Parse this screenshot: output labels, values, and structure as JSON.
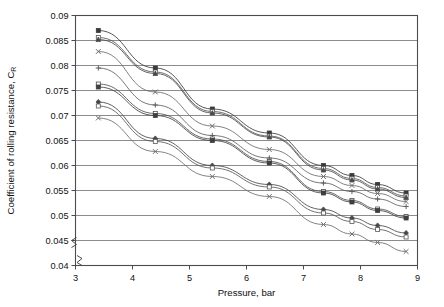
{
  "chart_data": {
    "type": "line",
    "title": "",
    "xlabel": "Pressure, bar",
    "ylabel": "Coefficient of rolling resistance, C",
    "ylabel_sub": "R",
    "xlim": [
      3,
      9
    ],
    "ylim": [
      0.04,
      0.09
    ],
    "y_axis_break": true,
    "grid": true,
    "legend": "none",
    "xticks": [
      3,
      4,
      5,
      6,
      7,
      8,
      9
    ],
    "xticklabels": [
      "3",
      "4",
      "5",
      "6",
      "7",
      "8",
      "9"
    ],
    "yticks": [
      0.04,
      0.045,
      0.05,
      0.055,
      0.06,
      0.065,
      0.07,
      0.075,
      0.08,
      0.085,
      0.09
    ],
    "yticklabels": [
      "0.04",
      "0.045",
      "0.05",
      "0.055",
      "0.06",
      "0.065",
      "0.07",
      "0.075",
      "0.08",
      "0.085",
      "0.09"
    ],
    "x": [
      3.4,
      4.4,
      5.4,
      6.4,
      7.35,
      7.85,
      8.3,
      8.8
    ],
    "series": [
      {
        "name": "Series 1",
        "marker": "square-filled",
        "color": "#3a3a3a",
        "values": [
          0.087,
          0.0795,
          0.0713,
          0.0665,
          0.06,
          0.058,
          0.0562,
          0.0545
        ]
      },
      {
        "name": "Series 2",
        "marker": "square-open",
        "color": "#555555",
        "values": [
          0.0856,
          0.0787,
          0.0708,
          0.0659,
          0.0594,
          0.0574,
          0.0556,
          0.0539
        ]
      },
      {
        "name": "Series 3",
        "marker": "triangle-filled",
        "color": "#4a4a4a",
        "values": [
          0.0852,
          0.0784,
          0.0705,
          0.0657,
          0.0591,
          0.0571,
          0.0553,
          0.0536
        ]
      },
      {
        "name": "Series 4",
        "marker": "cross",
        "color": "#6a6a6a",
        "values": [
          0.0828,
          0.0747,
          0.0679,
          0.0632,
          0.0578,
          0.056,
          0.0544,
          0.0528
        ]
      },
      {
        "name": "Series 5",
        "marker": "plus",
        "color": "#5e5e5e",
        "values": [
          0.0795,
          0.0721,
          0.066,
          0.0615,
          0.0565,
          0.0548,
          0.0533,
          0.0518
        ]
      },
      {
        "name": "Series 6",
        "marker": "square-open",
        "color": "#4f4f4f",
        "values": [
          0.0763,
          0.0704,
          0.0653,
          0.0608,
          0.0548,
          0.053,
          0.0513,
          0.0498
        ]
      },
      {
        "name": "Series 7",
        "marker": "square-filled",
        "color": "#3f3f3f",
        "values": [
          0.0757,
          0.07,
          0.065,
          0.0605,
          0.0545,
          0.0527,
          0.051,
          0.0495
        ]
      },
      {
        "name": "Series 8",
        "marker": "diamond-filled",
        "color": "#464646",
        "values": [
          0.0727,
          0.0654,
          0.06,
          0.0562,
          0.0512,
          0.0495,
          0.048,
          0.0465
        ]
      },
      {
        "name": "Series 9",
        "marker": "square-open",
        "color": "#585858",
        "values": [
          0.0719,
          0.0648,
          0.0595,
          0.0557,
          0.0505,
          0.0488,
          0.0472,
          0.0457
        ]
      },
      {
        "name": "Series 10",
        "marker": "cross",
        "color": "#6d6d6d",
        "values": [
          0.0695,
          0.0628,
          0.0578,
          0.0538,
          0.0482,
          0.0463,
          0.0446,
          0.0428
        ]
      }
    ]
  }
}
